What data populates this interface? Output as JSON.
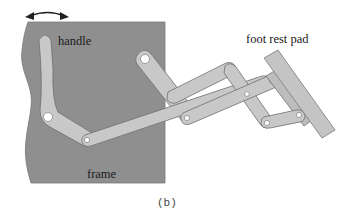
{
  "figure": {
    "caption": "(b)",
    "labels": {
      "handle": "handle",
      "frame": "frame",
      "foot_rest_pad": "foot rest pad"
    },
    "colors": {
      "frame_fill": "#8f8f8f",
      "link_fill": "#c8c8c8",
      "link_stroke": "#6e6e6e",
      "pad_fill": "#c4c4c4",
      "joint_fill": "#ffffff",
      "arrow": "#222222"
    },
    "components": [
      "frame",
      "handle",
      "upper crank",
      "long link",
      "scissor links",
      "foot rest pad"
    ],
    "motion_indicator": "double-headed arrow above handle"
  }
}
